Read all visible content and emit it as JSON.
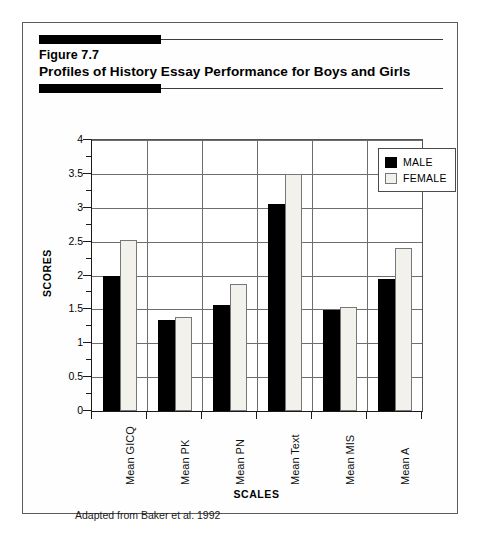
{
  "figure": {
    "number_label": "Figure 7.7",
    "title": "Profiles of History Essay Performance for Boys and Girls",
    "caption": "Adapted from Baker et al. 1992"
  },
  "legend": {
    "entries": [
      {
        "label": "MALE",
        "swatch": "black-square-swatch",
        "color": "#000000"
      },
      {
        "label": "FEMALE",
        "swatch": "white-square-swatch",
        "color": "#f2f1ec"
      }
    ]
  },
  "chart_data": {
    "type": "bar",
    "title": "Profiles of History Essay Performance for Boys and Girls",
    "subtitle": "Figure 7.7",
    "xlabel": "SCALES",
    "ylabel": "SCORES",
    "ylim": [
      0,
      4
    ],
    "yticks": [
      0,
      0.5,
      1,
      1.5,
      2,
      2.5,
      3,
      3.5,
      4
    ],
    "ytick_labels": [
      "0",
      "0.5",
      "1",
      "1.5",
      "2",
      "2.5",
      "3",
      "3.5",
      "4"
    ],
    "grid": "horizontal-and-vertical",
    "legend_position": "top-right inside plot",
    "categories": [
      "Mean GICQ",
      "Mean PK",
      "Mean PN",
      "Mean Text",
      "Mean MIS",
      "Mean A"
    ],
    "series": [
      {
        "name": "MALE",
        "color": "#000000",
        "values": [
          2.0,
          1.35,
          1.56,
          3.05,
          1.49,
          1.95
        ]
      },
      {
        "name": "FEMALE",
        "color": "#f2f1ec",
        "values": [
          2.53,
          1.39,
          1.88,
          3.5,
          1.53,
          2.4
        ]
      }
    ],
    "annotations": [
      "Adapted from Baker et al. 1992"
    ]
  }
}
